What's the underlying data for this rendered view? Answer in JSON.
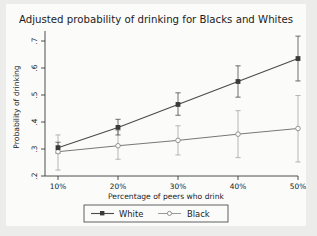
{
  "chart_data": {
    "type": "line",
    "title": "Adjusted probability of drinking for Blacks and Whites",
    "xlabel": "Percentage of peers who drink",
    "ylabel": "Probability of drinking",
    "categories": [
      "10%",
      "20%",
      "30%",
      "40%",
      "50%"
    ],
    "x": [
      10,
      20,
      30,
      40,
      50
    ],
    "xtick_labels": [
      "10%",
      "20%",
      "30%",
      "40%",
      "50%"
    ],
    "ytick_labels": [
      ".2",
      ".3",
      ".4",
      ".5",
      ".6",
      ".7"
    ],
    "ytick_values": [
      0.2,
      0.3,
      0.4,
      0.5,
      0.6,
      0.7
    ],
    "ylim": [
      0.185,
      0.72
    ],
    "xlim": [
      8,
      52
    ],
    "grid": false,
    "legend_position": "bottom",
    "series": [
      {
        "name": "White",
        "marker": "filled-square",
        "color": "#4a4a4a",
        "values": [
          0.305,
          0.38,
          0.465,
          0.55,
          0.635
        ],
        "ci_low": [
          0.285,
          0.352,
          0.425,
          0.492,
          0.552
        ],
        "ci_high": [
          0.325,
          0.41,
          0.508,
          0.608,
          0.718
        ]
      },
      {
        "name": "Black",
        "marker": "open-circle",
        "color": "#9a9a9a",
        "values": [
          0.29,
          0.312,
          0.332,
          0.355,
          0.376
        ],
        "ci_low": [
          0.222,
          0.262,
          0.278,
          0.268,
          0.252
        ],
        "ci_high": [
          0.352,
          0.368,
          0.386,
          0.442,
          0.498
        ]
      }
    ]
  },
  "legend": {
    "items": [
      {
        "label": "White"
      },
      {
        "label": "Black"
      }
    ]
  },
  "colors": {
    "page_background": "#ececeb",
    "plot_background": "#fbfbfa",
    "axis": "#3a3a3a",
    "white_series": "#4a4a4a",
    "black_series": "#9a9a9a"
  }
}
